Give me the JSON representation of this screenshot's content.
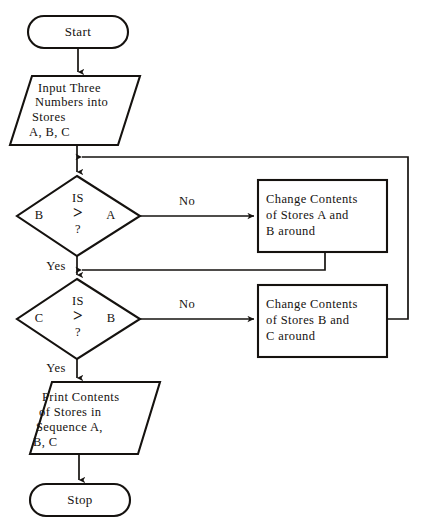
{
  "diagram": {
    "line_color": "#15120f",
    "text_color": "#15120f",
    "background": "#ffffff"
  },
  "nodes": {
    "start": {
      "shape": "terminator",
      "label": "Start"
    },
    "input": {
      "shape": "parallelogram",
      "line1": "Input Three",
      "line2": "Numbers into",
      "line3": "Stores",
      "line4": "A, B, C"
    },
    "decision1": {
      "shape": "diamond",
      "is": "IS",
      "operator": ">",
      "question": "?",
      "left": "B",
      "right": "A"
    },
    "process1": {
      "shape": "process",
      "line1": "Change Contents",
      "line2": "of Stores A and",
      "line3": "B around"
    },
    "decision2": {
      "shape": "diamond",
      "is": "IS",
      "operator": ">",
      "question": "?",
      "left": "C",
      "right": "B"
    },
    "process2": {
      "shape": "process",
      "line1": "Change Contents",
      "line2": "of Stores B and",
      "line3": "C around"
    },
    "output": {
      "shape": "parallelogram",
      "line1": "Print Contents",
      "line2": "of Stores in",
      "line3": "Sequence A,",
      "line4": "B, C"
    },
    "stop": {
      "shape": "terminator",
      "label": "Stop"
    }
  },
  "edges": {
    "decision1_no": "No",
    "decision1_yes": "Yes",
    "decision2_no": "No",
    "decision2_yes": "Yes"
  }
}
